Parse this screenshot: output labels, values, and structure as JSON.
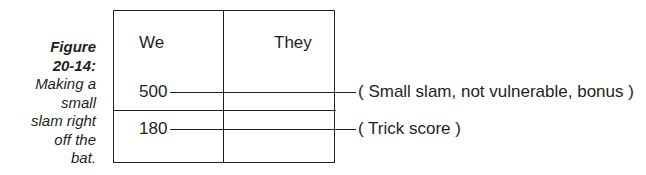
{
  "caption": {
    "figure_label": "Figure 20-14:",
    "figure_line1": "Figure",
    "figure_line2": "20-14:",
    "text_lines": [
      "Making a",
      "small",
      "slam right",
      "off the",
      "bat."
    ]
  },
  "scoresheet": {
    "columns": [
      "We",
      "They"
    ],
    "entries": [
      {
        "side": "We",
        "value": "500",
        "note": "( Small slam, not vulnerable, bonus )",
        "position": "above the line"
      },
      {
        "side": "We",
        "value": "180",
        "note": "( Trick score )",
        "position": "below the line"
      }
    ]
  },
  "colors": {
    "ink": "#231f20",
    "background": "#ffffff"
  }
}
